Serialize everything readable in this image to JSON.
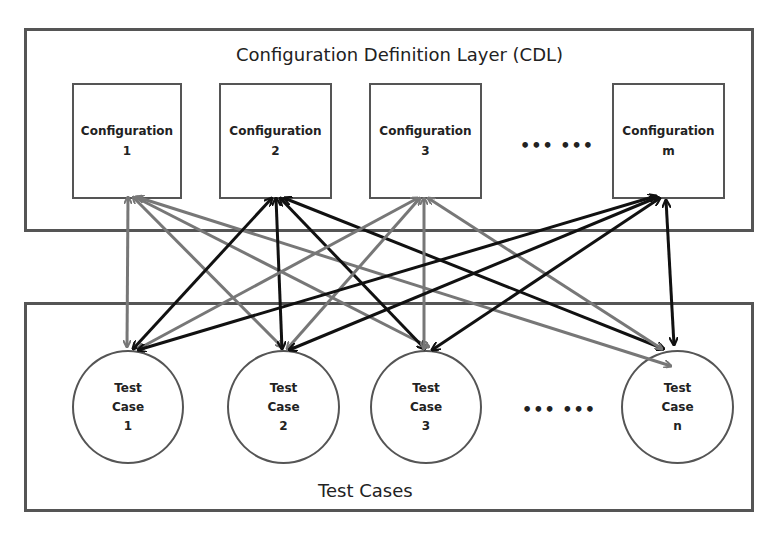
{
  "cdl_layer": {
    "title": "Configuration Definition Layer (CDL)",
    "configs": [
      {
        "label": "Configuration",
        "index": "1"
      },
      {
        "label": "Configuration",
        "index": "2"
      },
      {
        "label": "Configuration",
        "index": "3"
      },
      {
        "label": "Configuration",
        "index": "m"
      }
    ],
    "ellipsis": "••• •••"
  },
  "test_layer": {
    "title": "Test Cases",
    "cases": [
      {
        "line1": "Test",
        "line2": "Case",
        "index": "1"
      },
      {
        "line1": "Test",
        "line2": "Case",
        "index": "2"
      },
      {
        "line1": "Test",
        "line2": "Case",
        "index": "3"
      },
      {
        "line1": "Test",
        "line2": "Case",
        "index": "n"
      }
    ],
    "ellipsis": "••• •••"
  },
  "colors": {
    "gray_edge": "#777777",
    "black_edge": "#111111",
    "border": "#555555"
  },
  "edges": {
    "gray_from_config_1": [
      "1",
      "2",
      "3",
      "n"
    ],
    "black_from_config_2": [
      "1",
      "2",
      "3",
      "n"
    ],
    "gray_from_config_3": [
      "1",
      "2",
      "3",
      "n"
    ],
    "black_from_config_m": [
      "1",
      "2",
      "3",
      "n"
    ]
  }
}
